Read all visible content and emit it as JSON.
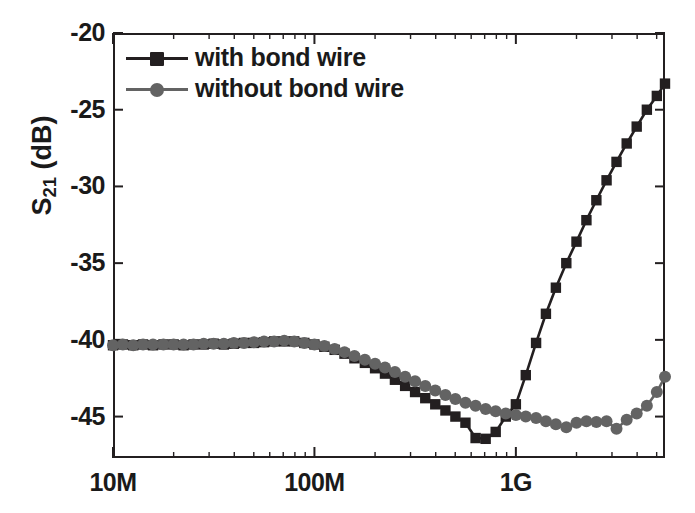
{
  "chart_data": {
    "type": "line",
    "title": "",
    "subtitle": "",
    "xlabel": "",
    "ylabel": "S21 (dB)",
    "ylabel_base": "S",
    "ylabel_sub": "21",
    "ylabel_unit": " (dB)",
    "x_scale": "log",
    "x_unit": "Hz",
    "xlim": [
      10000000,
      5500000000
    ],
    "ylim": [
      -47.7,
      -20
    ],
    "grid": false,
    "legend_position": "top-left",
    "y_ticks": [
      -20,
      -25,
      -30,
      -35,
      -40,
      -45
    ],
    "y_tick_labels": [
      "-20",
      "-25",
      "-30",
      "-35",
      "-40",
      "-45"
    ],
    "x_ticks": [
      10000000,
      100000000,
      1000000000
    ],
    "x_tick_labels": [
      "10M",
      "100M",
      "1G"
    ],
    "colors": {
      "with_bond_wire": "#231f20",
      "without_bond_wire": "#636363",
      "axis": "#231f20",
      "text": "#1a1a1a",
      "background": "#ffffff"
    },
    "series": [
      {
        "name": "with bond wire",
        "label": "with bond wire",
        "marker": "square",
        "color": "#231f20",
        "points": [
          [
            10000000,
            -40.35
          ],
          [
            11200000,
            -40.3
          ],
          [
            12600000,
            -40.35
          ],
          [
            14100000,
            -40.3
          ],
          [
            15800000,
            -40.35
          ],
          [
            17800000,
            -40.3
          ],
          [
            20000000,
            -40.3
          ],
          [
            22400000,
            -40.35
          ],
          [
            25100000,
            -40.3
          ],
          [
            28200000,
            -40.3
          ],
          [
            31600000,
            -40.25
          ],
          [
            35500000,
            -40.3
          ],
          [
            39800000,
            -40.25
          ],
          [
            44700000,
            -40.2
          ],
          [
            50100000,
            -40.2
          ],
          [
            56200000,
            -40.15
          ],
          [
            63100000,
            -40.1
          ],
          [
            70800000,
            -40.1
          ],
          [
            79400000,
            -40.1
          ],
          [
            89100000,
            -40.2
          ],
          [
            100000000,
            -40.3
          ],
          [
            112000000,
            -40.45
          ],
          [
            126000000,
            -40.65
          ],
          [
            141000000,
            -40.9
          ],
          [
            158000000,
            -41.2
          ],
          [
            178000000,
            -41.5
          ],
          [
            200000000,
            -41.85
          ],
          [
            224000000,
            -42.2
          ],
          [
            251000000,
            -42.6
          ],
          [
            282000000,
            -43.0
          ],
          [
            316000000,
            -43.4
          ],
          [
            355000000,
            -43.8
          ],
          [
            398000000,
            -44.2
          ],
          [
            447000000,
            -44.6
          ],
          [
            501000000,
            -45.0
          ],
          [
            562000000,
            -45.4
          ],
          [
            631000000,
            -46.4
          ],
          [
            708000000,
            -46.45
          ],
          [
            794000000,
            -46.0
          ],
          [
            891000000,
            -45.0
          ],
          [
            1000000000,
            -44.2
          ],
          [
            1120000000,
            -42.3
          ],
          [
            1260000000,
            -40.2
          ],
          [
            1410000000,
            -38.3
          ],
          [
            1580000000,
            -36.6
          ],
          [
            1780000000,
            -35.0
          ],
          [
            2000000000,
            -33.6
          ],
          [
            2240000000,
            -32.2
          ],
          [
            2510000000,
            -30.9
          ],
          [
            2820000000,
            -29.6
          ],
          [
            3160000000,
            -28.4
          ],
          [
            3550000000,
            -27.2
          ],
          [
            3980000000,
            -26.1
          ],
          [
            4470000000,
            -25.0
          ],
          [
            5010000000,
            -24.1
          ],
          [
            5500000000,
            -23.3
          ]
        ]
      },
      {
        "name": "without bond wire",
        "label": "without bond wire",
        "marker": "circle",
        "color": "#636363",
        "points": [
          [
            10000000,
            -40.35
          ],
          [
            11200000,
            -40.3
          ],
          [
            12600000,
            -40.35
          ],
          [
            14100000,
            -40.3
          ],
          [
            15800000,
            -40.3
          ],
          [
            17800000,
            -40.3
          ],
          [
            20000000,
            -40.3
          ],
          [
            22400000,
            -40.3
          ],
          [
            25100000,
            -40.3
          ],
          [
            28200000,
            -40.25
          ],
          [
            31600000,
            -40.25
          ],
          [
            35500000,
            -40.25
          ],
          [
            39800000,
            -40.2
          ],
          [
            44700000,
            -40.2
          ],
          [
            50100000,
            -40.15
          ],
          [
            56200000,
            -40.1
          ],
          [
            63100000,
            -40.1
          ],
          [
            70800000,
            -40.05
          ],
          [
            79400000,
            -40.1
          ],
          [
            89100000,
            -40.2
          ],
          [
            100000000,
            -40.3
          ],
          [
            112000000,
            -40.4
          ],
          [
            126000000,
            -40.6
          ],
          [
            141000000,
            -40.8
          ],
          [
            158000000,
            -41.05
          ],
          [
            178000000,
            -41.3
          ],
          [
            200000000,
            -41.55
          ],
          [
            224000000,
            -41.8
          ],
          [
            251000000,
            -42.1
          ],
          [
            282000000,
            -42.4
          ],
          [
            316000000,
            -42.7
          ],
          [
            355000000,
            -43.0
          ],
          [
            398000000,
            -43.3
          ],
          [
            447000000,
            -43.6
          ],
          [
            501000000,
            -43.85
          ],
          [
            562000000,
            -44.1
          ],
          [
            631000000,
            -44.3
          ],
          [
            708000000,
            -44.5
          ],
          [
            794000000,
            -44.65
          ],
          [
            891000000,
            -44.8
          ],
          [
            1000000000,
            -44.9
          ],
          [
            1120000000,
            -45.0
          ],
          [
            1260000000,
            -45.1
          ],
          [
            1410000000,
            -45.3
          ],
          [
            1580000000,
            -45.5
          ],
          [
            1780000000,
            -45.7
          ],
          [
            2000000000,
            -45.4
          ],
          [
            2240000000,
            -45.3
          ],
          [
            2510000000,
            -45.35
          ],
          [
            2820000000,
            -45.3
          ],
          [
            3160000000,
            -45.8
          ],
          [
            3550000000,
            -45.2
          ],
          [
            3980000000,
            -44.8
          ],
          [
            4470000000,
            -44.3
          ],
          [
            5010000000,
            -43.4
          ],
          [
            5500000000,
            -42.4
          ]
        ]
      }
    ]
  }
}
